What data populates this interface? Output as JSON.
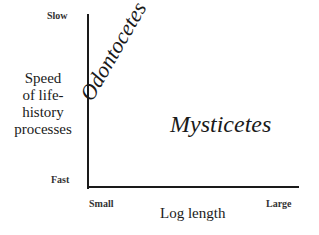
{
  "diagram": {
    "y_axis": {
      "title": "Speed of life-history processes",
      "title_lines": [
        "Speed",
        "of life-",
        "history",
        "processes"
      ],
      "top_label": "Slow",
      "bottom_label": "Fast"
    },
    "x_axis": {
      "title": "Log length",
      "left_label": "Small",
      "right_label": "Large"
    },
    "regions": [
      {
        "label": "Odontocetes",
        "position": "upper-left, rotated diagonal"
      },
      {
        "label": "Mysticetes",
        "position": "lower-right"
      }
    ],
    "colors": {
      "axis": "#1a1a1a",
      "text": "#1a1a1a",
      "background": "#ffffff"
    }
  }
}
